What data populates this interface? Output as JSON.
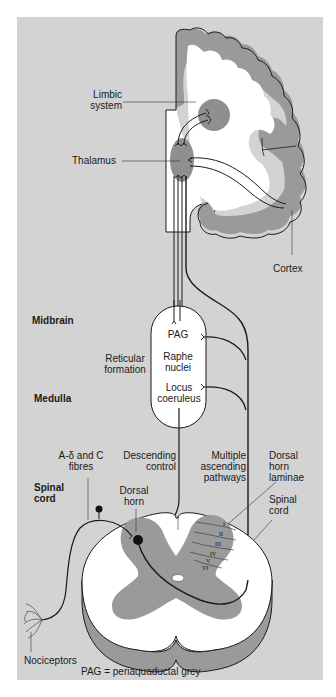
{
  "diagram": {
    "regions": {
      "midbrain": "Midbrain",
      "medulla": "Medulla",
      "spinal_cord_left": "Spinal cord"
    },
    "labels": {
      "limbic_system": "Limbic system",
      "thalamus": "Thalamus",
      "cortex": "Cortex",
      "reticular_formation": "Reticular formation",
      "pag": "PAG",
      "raphe_nuclei": "Raphe nuclei",
      "locus_coeruleus": "Locus coeruleus",
      "a_delta_c_fibres": "A-δ and C fibres",
      "descending_control": "Descending control",
      "multiple_ascending_pathways": "Multiple ascending pathways",
      "dorsal_horn_laminae": "Dorsal horn laminae",
      "dorsal_horn": "Dorsal horn",
      "spinal_cord_right": "Spinal cord",
      "nociceptors": "Nociceptors"
    },
    "laminae": [
      "I",
      "II",
      "III",
      "IV",
      "V",
      "VI"
    ],
    "footnote": "PAG = periaquaductal grey",
    "colors": {
      "background": "#d3d3d3",
      "grey_matter": "#9a9a9a",
      "white_matter": "#ffffff",
      "outline": "#111111",
      "page": "#ffffff"
    }
  }
}
